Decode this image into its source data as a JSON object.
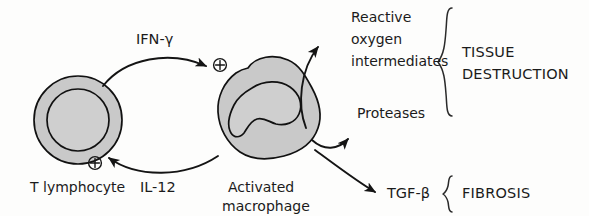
{
  "diagram": {
    "colors": {
      "cell_fill": "#c9c9c9",
      "nucleus_fill": "#cfcfcf",
      "outline": "#111111",
      "text": "#1b1b1b",
      "background": "#fdfdfc"
    },
    "cells": [
      {
        "id": "t-lymphocyte",
        "label": "T lymphocyte",
        "shape": "circle-with-nucleus"
      },
      {
        "id": "activated-macrophage",
        "label_line1": "Activated",
        "label_line2": "macrophage",
        "shape": "irregular-blob-with-kidney-nucleus"
      }
    ],
    "cytokines": [
      {
        "id": "ifn-gamma",
        "label": "IFN-γ",
        "direction": "t-lymphocyte-to-macrophage"
      },
      {
        "id": "il-12",
        "label": "IL-12",
        "direction": "macrophage-to-t-lymphocyte"
      },
      {
        "id": "tgf-beta",
        "label": "TGF-β",
        "direction": "macrophage-to-fibrosis"
      }
    ],
    "activation_markers": [
      {
        "id": "plus-macrophage",
        "symbol": "⊕"
      },
      {
        "id": "plus-lymphocyte",
        "symbol": "⊕"
      }
    ],
    "effectors": [
      {
        "id": "reactive-oxygen-intermediates",
        "line1": "Reactive",
        "line2": "oxygen",
        "line3": "intermediates"
      },
      {
        "id": "proteases",
        "line1": "Proteases"
      }
    ],
    "outcomes": [
      {
        "id": "tissue-destruction",
        "line1": "TISSUE",
        "line2": "DESTRUCTION"
      },
      {
        "id": "fibrosis",
        "line1": "FIBROSIS"
      }
    ]
  }
}
